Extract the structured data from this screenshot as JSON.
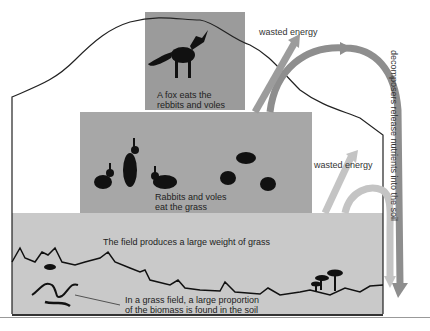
{
  "diagram": {
    "levels": [
      {
        "name": "fox",
        "label_line1": "A fox eats the",
        "label_line2": "rebbits and voles"
      },
      {
        "name": "rabbits-voles",
        "label_line1": "Rabbits and voles",
        "label_line2": "eat the grass"
      },
      {
        "name": "field",
        "label": "The field produces a large weight of grass"
      }
    ],
    "soil_note_line1": "In a grass field, a large proportion",
    "soil_note_line2": "of the biomass is found in the soil",
    "wasted_energy_top": "wasted energy",
    "wasted_energy_middle": "wasted energy",
    "decomposers_line1": "decomposers release",
    "decomposers_line2": "nutrients into the soil",
    "colors": {
      "fox_box": "#9b9b9b",
      "rabbit_box": "#a7a7a7",
      "field_box": "#c9c9c9",
      "arrow_dark": "#8e8e8e",
      "arrow_light": "#c4c4c4",
      "silhouette": "#111111"
    }
  }
}
